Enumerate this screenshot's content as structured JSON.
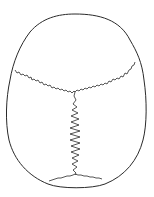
{
  "diagram": {
    "subject": "Skull, superior view",
    "stroke_color": "#2a2a2a",
    "background": "#ffffff",
    "parts": [
      {
        "id": "outline",
        "label": "Cranial outline"
      },
      {
        "id": "coronal",
        "label": "Coronal suture"
      },
      {
        "id": "sagittal",
        "label": "Sagittal suture"
      },
      {
        "id": "lambdoid",
        "label": "Lambdoid suture"
      }
    ]
  }
}
